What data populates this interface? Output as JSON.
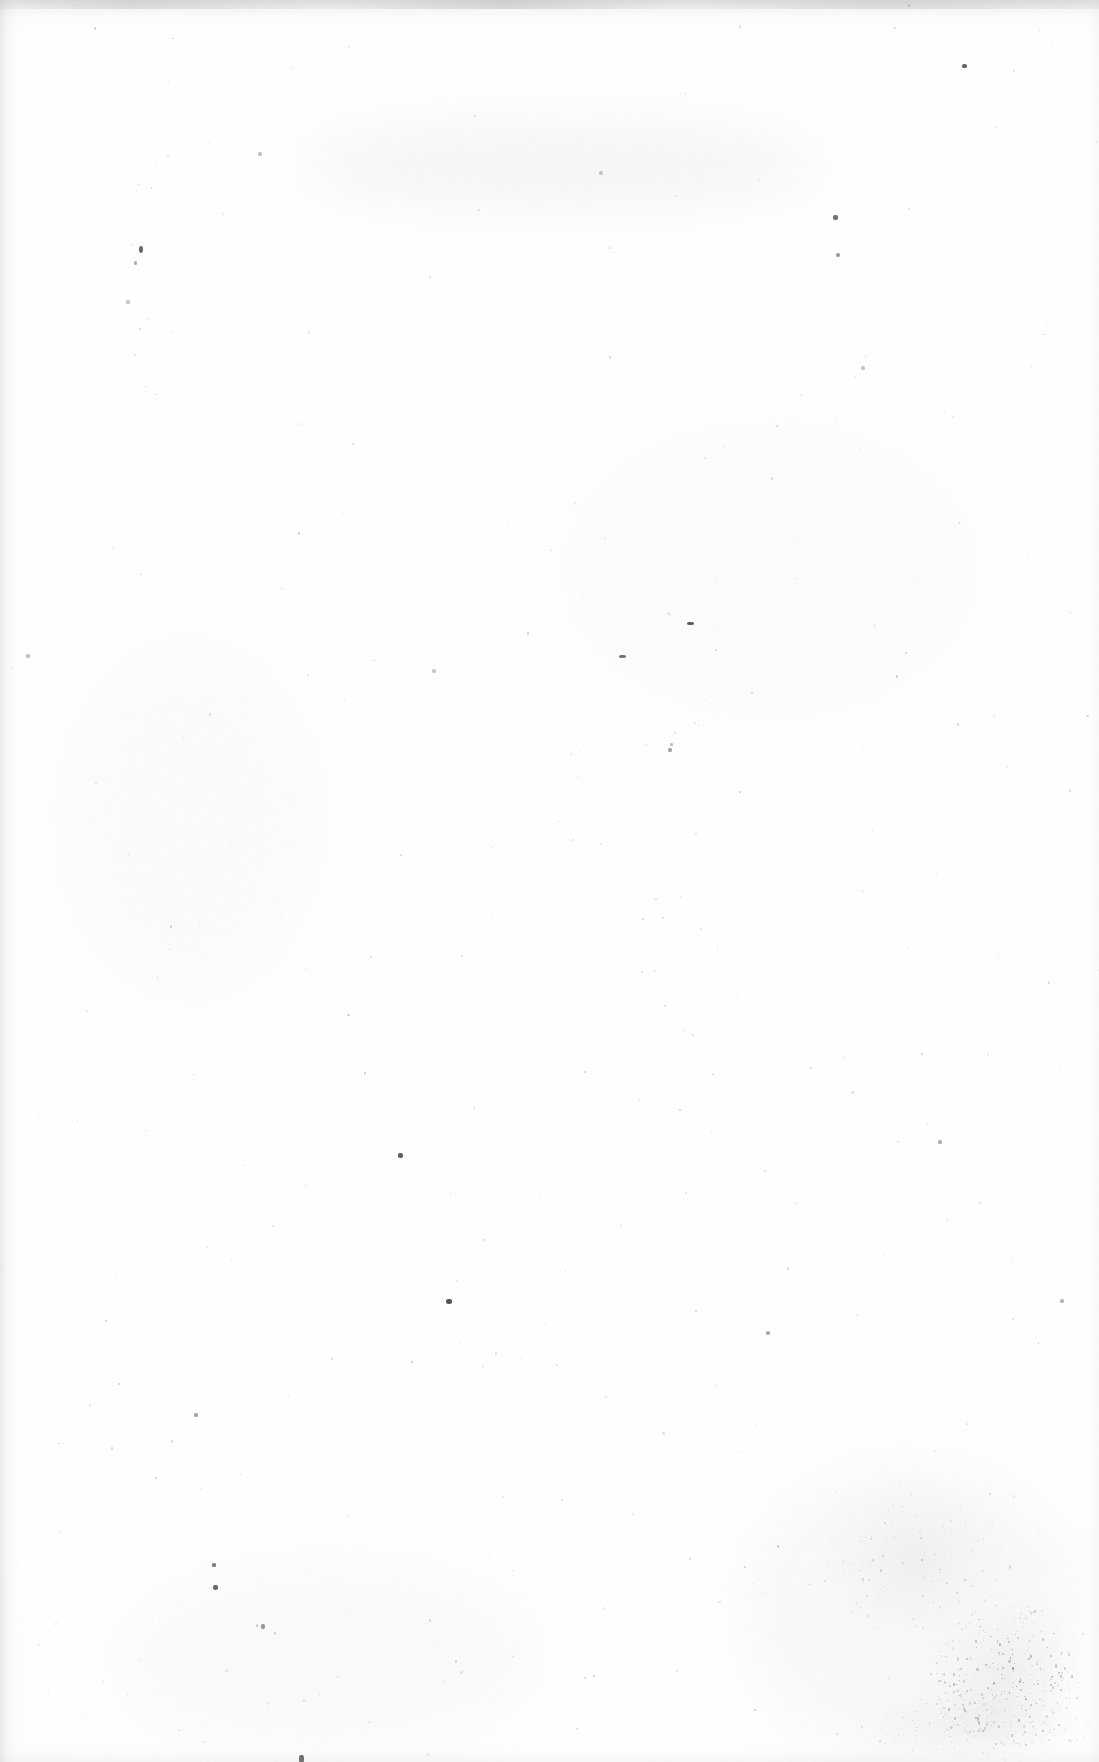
{
  "document": {
    "kind": "scanned-blank-page",
    "page_content_text": "",
    "visible_text": "",
    "description": "Blank scanned page from an aged printed book; no text, headings, figures, page number or marginalia are present.",
    "page_number_label": "",
    "caption": ""
  },
  "canvas": {
    "width": 1099,
    "height": 1762,
    "background_color": "#ffffff",
    "paper_tone": "#fdfdfd",
    "ink_color": "#55565a"
  },
  "edges": {
    "top_shadow_color": "#a8aaae",
    "left_shadow_color": "#acaeb2",
    "right_shadow_color": "#ccced2",
    "bottom_shadow_color": "#ced0d4"
  },
  "tone_blotches": [
    {
      "x": 300,
      "y": 120,
      "w": 520,
      "h": 90,
      "color": "rgba(200,202,206,0.16)"
    },
    {
      "x": 60,
      "y": 640,
      "w": 260,
      "h": 360,
      "color": "rgba(236,237,239,0.22)"
    },
    {
      "x": 560,
      "y": 420,
      "w": 420,
      "h": 300,
      "color": "rgba(240,241,243,0.18)"
    },
    {
      "x": 740,
      "y": 1460,
      "w": 340,
      "h": 300,
      "color": "rgba(198,196,194,0.10)"
    },
    {
      "x": 120,
      "y": 1560,
      "w": 420,
      "h": 190,
      "color": "rgba(228,229,231,0.18)"
    }
  ],
  "foxing_clusters": [
    {
      "x": 930,
      "y": 1600,
      "w": 150,
      "h": 150,
      "density": 300,
      "max_radius": 2.0,
      "opacity": 0.55,
      "label": "foxing-stain-bottom-right"
    },
    {
      "x": 820,
      "y": 1480,
      "w": 190,
      "h": 160,
      "density": 130,
      "max_radius": 1.6,
      "opacity": 0.32,
      "label": "foxing-stain-lower-right"
    },
    {
      "x": 860,
      "y": 1690,
      "w": 230,
      "h": 72,
      "density": 120,
      "max_radius": 1.6,
      "opacity": 0.36,
      "label": "foxing-stain-bottom-edge"
    }
  ],
  "fiber_trails": [
    {
      "x": 128,
      "y": 155,
      "w": 34,
      "h": 250,
      "count": 22,
      "opacity": 0.3,
      "label": "fiber-trail-upper-left"
    },
    {
      "x": 638,
      "y": 610,
      "w": 80,
      "h": 400,
      "count": 26,
      "opacity": 0.26,
      "label": "fiber-trail-center-right"
    },
    {
      "x": 560,
      "y": 690,
      "w": 120,
      "h": 160,
      "count": 14,
      "opacity": 0.24,
      "label": "fiber-trail-center"
    }
  ],
  "specks": [
    {
      "x": 962,
      "y": 64,
      "w": 5,
      "h": 4,
      "color": "rgba(60,60,64,0.80)"
    },
    {
      "x": 833,
      "y": 215,
      "w": 5,
      "h": 5,
      "color": "rgba(70,70,74,0.78)"
    },
    {
      "x": 836,
      "y": 253,
      "w": 4,
      "h": 4,
      "color": "rgba(95,95,99,0.62)"
    },
    {
      "x": 139,
      "y": 246,
      "w": 4,
      "h": 7,
      "color": "rgba(64,64,68,0.78)"
    },
    {
      "x": 134,
      "y": 261,
      "w": 3,
      "h": 4,
      "color": "rgba(110,110,114,0.55)"
    },
    {
      "x": 687,
      "y": 622,
      "w": 7,
      "h": 3,
      "color": "rgba(52,52,56,0.82)"
    },
    {
      "x": 619,
      "y": 655,
      "w": 7,
      "h": 3,
      "color": "rgba(60,60,64,0.72)"
    },
    {
      "x": 668,
      "y": 748,
      "w": 4,
      "h": 4,
      "color": "rgba(98,98,102,0.58)"
    },
    {
      "x": 670,
      "y": 743,
      "w": 3,
      "h": 3,
      "color": "rgba(118,118,122,0.48)"
    },
    {
      "x": 398,
      "y": 1153,
      "w": 5,
      "h": 5,
      "color": "rgba(58,58,62,0.82)"
    },
    {
      "x": 446,
      "y": 1299,
      "w": 6,
      "h": 5,
      "color": "rgba(48,48,52,0.84)"
    },
    {
      "x": 212,
      "y": 1563,
      "w": 4,
      "h": 4,
      "color": "rgba(72,72,76,0.72)"
    },
    {
      "x": 213,
      "y": 1585,
      "w": 5,
      "h": 5,
      "color": "rgba(62,62,66,0.78)"
    },
    {
      "x": 261,
      "y": 1624,
      "w": 4,
      "h": 5,
      "color": "rgba(88,88,92,0.62)"
    },
    {
      "x": 299,
      "y": 1755,
      "w": 5,
      "h": 8,
      "color": "rgba(54,54,58,0.80)"
    },
    {
      "x": 194,
      "y": 1413,
      "w": 4,
      "h": 4,
      "color": "rgba(96,96,100,0.58)"
    },
    {
      "x": 938,
      "y": 1140,
      "w": 4,
      "h": 4,
      "color": "rgba(104,104,108,0.52)"
    },
    {
      "x": 766,
      "y": 1331,
      "w": 4,
      "h": 4,
      "color": "rgba(102,102,106,0.54)"
    },
    {
      "x": 1060,
      "y": 1299,
      "w": 4,
      "h": 4,
      "color": "rgba(106,106,110,0.50)"
    },
    {
      "x": 258,
      "y": 152,
      "w": 4,
      "h": 4,
      "color": "rgba(120,120,124,0.46)"
    },
    {
      "x": 126,
      "y": 300,
      "w": 4,
      "h": 4,
      "color": "rgba(122,122,126,0.44)"
    },
    {
      "x": 599,
      "y": 171,
      "w": 4,
      "h": 4,
      "color": "rgba(124,124,128,0.42)"
    },
    {
      "x": 861,
      "y": 366,
      "w": 4,
      "h": 4,
      "color": "rgba(120,120,124,0.44)"
    },
    {
      "x": 26,
      "y": 654,
      "w": 4,
      "h": 4,
      "color": "rgba(118,118,122,0.46)"
    },
    {
      "x": 432,
      "y": 669,
      "w": 4,
      "h": 4,
      "color": "rgba(124,124,128,0.42)"
    }
  ],
  "interaction": {
    "clickable_elements": 0,
    "note": "Static scanned image; no interface controls present."
  }
}
